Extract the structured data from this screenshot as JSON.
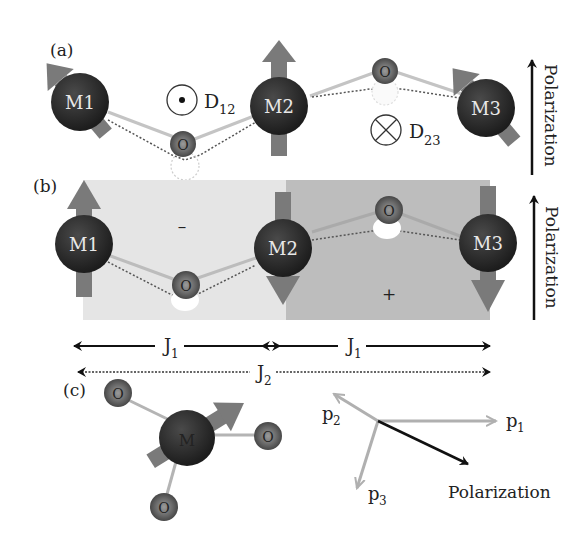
{
  "panels": {
    "a": {
      "label": "(a)",
      "atoms": [
        {
          "id": "M1",
          "label": "M1"
        },
        {
          "id": "M2",
          "label": "M2"
        },
        {
          "id": "M3",
          "label": "M3"
        }
      ],
      "oxygen_label": "O",
      "dm_vectors": [
        {
          "symbol": "out-of-plane (dot)",
          "label": "D",
          "sub": "12"
        },
        {
          "symbol": "into-plane (cross)",
          "label": "D",
          "sub": "23"
        }
      ],
      "polarization_label": "Polarization"
    },
    "b": {
      "label": "(b)",
      "atoms": [
        {
          "id": "M1",
          "label": "M1"
        },
        {
          "id": "M2",
          "label": "M2"
        },
        {
          "id": "M3",
          "label": "M3"
        }
      ],
      "oxygen_label": "O",
      "region_signs": [
        "–",
        "+"
      ],
      "polarization_label": "Polarization",
      "exchange": [
        {
          "label": "J",
          "sub": "1"
        },
        {
          "label": "J",
          "sub": "1"
        },
        {
          "label": "J",
          "sub": "2"
        }
      ]
    },
    "c": {
      "label": "(c)",
      "center_atom": "M",
      "oxygen_label": "O",
      "vectors": [
        {
          "label": "p",
          "sub": "1"
        },
        {
          "label": "p",
          "sub": "2"
        },
        {
          "label": "p",
          "sub": "3"
        }
      ],
      "polarization_label": "Polarization"
    }
  },
  "colors": {
    "atom_metal": "#2a2a2a",
    "atom_oxygen": "#5a5a5a",
    "spin_arrow": "#7a7a7a",
    "bond_solid": "#bdbdbd",
    "bond_dotted": "#555555",
    "region_light": "#e6e6e6",
    "region_dark": "#bcbcbc",
    "p_vectors": "#b0b0b0",
    "polarization_arrow": "#111111"
  }
}
